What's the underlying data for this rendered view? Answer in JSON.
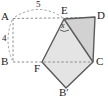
{
  "figure": {
    "type": "geometry-diagram",
    "colors": {
      "stroke": "#4a4a4a",
      "dashed": "#8a8a8a",
      "fill_light": "#e3e3e3",
      "fill_dark": "#cfcfcf",
      "text": "#1b1b1b"
    },
    "vertex_labels": {
      "A": "A",
      "B": "B",
      "C": "C",
      "D": "D",
      "E": "E",
      "F": "F",
      "Bprime": "B′"
    },
    "dimension_labels": {
      "top": "5",
      "left": "4"
    },
    "angle_labels": {
      "at_E": "x"
    },
    "points": {
      "A": [
        12,
        17
      ],
      "B": [
        12,
        62
      ],
      "C": [
        93,
        62
      ],
      "D": [
        95,
        17
      ],
      "E": [
        64,
        19
      ],
      "F": [
        42,
        62
      ],
      "Bprime": [
        66,
        88
      ]
    }
  }
}
